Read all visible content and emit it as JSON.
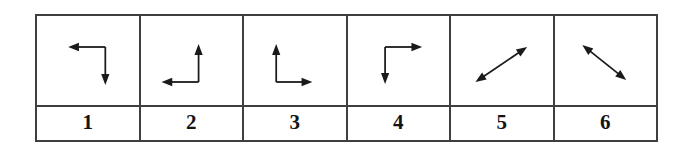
{
  "colors": {
    "border": "#3f3f3f",
    "arrow": "#1a1a1a",
    "number": "#141414",
    "background": "#ffffff"
  },
  "table": {
    "rows": [
      "arrow-figures",
      "numbers"
    ],
    "cells": [
      {
        "label": "1",
        "icon": "arrow-elbow-left-down-icon"
      },
      {
        "label": "2",
        "icon": "arrow-elbow-up-left-icon"
      },
      {
        "label": "3",
        "icon": "arrow-elbow-up-right-icon"
      },
      {
        "label": "4",
        "icon": "arrow-elbow-right-down-icon"
      },
      {
        "label": "5",
        "icon": "arrow-double-diagonal-up-right-icon"
      },
      {
        "label": "6",
        "icon": "arrow-double-diagonal-down-right-icon"
      }
    ]
  }
}
